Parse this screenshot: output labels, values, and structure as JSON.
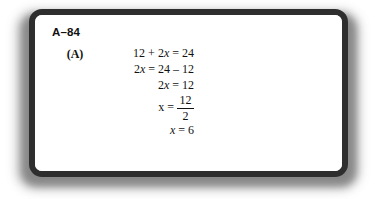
{
  "figure": {
    "problem_number": "A–84",
    "part_label": "(A)",
    "steps": [
      {
        "kind": "inline",
        "text": "12 + 2x = 24"
      },
      {
        "kind": "inline",
        "text": "2x = 24 – 12"
      },
      {
        "kind": "inline",
        "text": "2x = 12"
      },
      {
        "kind": "fraction",
        "lhs": "x =",
        "numerator": "12",
        "denominator": "2"
      },
      {
        "kind": "inline",
        "text": "x = 6"
      }
    ],
    "steps_flat": {
      "line1": "12 + 2x = 24",
      "line2": "2x = 24 – 12",
      "line3": "2x = 12",
      "line4_lhs": "x =",
      "line4_numerator": "12",
      "line4_denominator": "2",
      "line5": "x = 6"
    },
    "colors": {
      "frame_border": "#2e2e2e",
      "frame_fill": "#ffffff",
      "text": "#111111",
      "shadow": "#8e8e8e",
      "page_background": "#ffffff"
    }
  }
}
